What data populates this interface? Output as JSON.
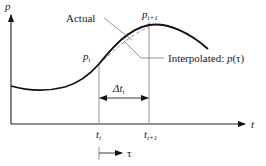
{
  "diagram": {
    "axes": {
      "y_label": "p",
      "x_label": "t"
    },
    "points": {
      "p_i": {
        "base": "p",
        "sub": "i"
      },
      "p_i1": {
        "base": "p",
        "sub": "i+1"
      }
    },
    "ticks": {
      "t_i": {
        "base": "t",
        "sub": "i"
      },
      "t_i1": {
        "base": "t",
        "sub": "i+1"
      }
    },
    "interval": {
      "base": "Δt",
      "sub": "i"
    },
    "annotations": {
      "actual": "Actual",
      "interpolated_prefix": "Interpolated: ",
      "interpolated_func": "p",
      "interpolated_arg": "(τ)"
    },
    "tau_label": "τ",
    "colors": {
      "curve": "#111111",
      "dashed": "#9a9a9a",
      "axis": "#222222",
      "guide": "#777777"
    }
  }
}
